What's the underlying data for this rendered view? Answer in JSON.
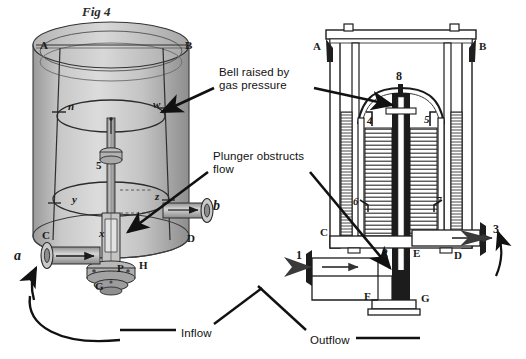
{
  "figure": {
    "title": "Fig 4",
    "background_color": "#ffffff",
    "ink_color": "#1a1a1a",
    "annotation_color": "#111111"
  },
  "annotations": [
    {
      "id": "bell-raised",
      "text": "Bell raised by\ngas pressure",
      "x": 219,
      "y": 66
    },
    {
      "id": "plunger-obstructs",
      "text": "Plunger obstructs\nflow",
      "x": 213,
      "y": 150
    },
    {
      "id": "inflow",
      "text": "Inflow",
      "x": 181,
      "y": 327
    },
    {
      "id": "outflow",
      "text": "Outflow",
      "x": 310,
      "y": 334
    }
  ],
  "left_view": {
    "name": "perspective-view",
    "labels": [
      {
        "id": "A",
        "text": "A",
        "x": 40,
        "y": 39,
        "style": "roman"
      },
      {
        "id": "B",
        "text": "B",
        "x": 185,
        "y": 39,
        "style": "roman"
      },
      {
        "id": "n",
        "text": "n",
        "x": 68,
        "y": 100,
        "style": "italic"
      },
      {
        "id": "w",
        "text": "w",
        "x": 153,
        "y": 98,
        "style": "italic"
      },
      {
        "id": "5",
        "text": "5",
        "x": 96,
        "y": 159,
        "style": "numeral"
      },
      {
        "id": "y",
        "text": "y",
        "x": 72,
        "y": 193,
        "style": "italic"
      },
      {
        "id": "z",
        "text": "z",
        "x": 155,
        "y": 190,
        "style": "italic"
      },
      {
        "id": "C",
        "text": "C",
        "x": 42,
        "y": 229,
        "style": "roman"
      },
      {
        "id": "D",
        "text": "D",
        "x": 187,
        "y": 232,
        "style": "roman"
      },
      {
        "id": "x",
        "text": "x",
        "x": 99,
        "y": 227,
        "style": "italic"
      },
      {
        "id": "a",
        "text": "a",
        "x": 14,
        "y": 252,
        "style": "italic"
      },
      {
        "id": "b",
        "text": "b",
        "x": 213,
        "y": 202,
        "style": "italic"
      },
      {
        "id": "P",
        "text": "P",
        "x": 117,
        "y": 267,
        "style": "roman"
      },
      {
        "id": "H",
        "text": "H",
        "x": 139,
        "y": 262,
        "style": "roman"
      },
      {
        "id": "G",
        "text": "G",
        "x": 97,
        "y": 285,
        "style": "roman"
      }
    ]
  },
  "right_view": {
    "name": "cross-section-view",
    "labels": [
      {
        "id": "A",
        "text": "A",
        "x": 315,
        "y": 44,
        "style": "roman"
      },
      {
        "id": "B",
        "text": "B",
        "x": 481,
        "y": 44,
        "style": "roman"
      },
      {
        "id": "8",
        "text": "8",
        "x": 396,
        "y": 86,
        "style": "numeral"
      },
      {
        "id": "4",
        "text": "4",
        "x": 368,
        "y": 119,
        "style": "numeral"
      },
      {
        "id": "5",
        "text": "5",
        "x": 424,
        "y": 118,
        "style": "numeral"
      },
      {
        "id": "6",
        "text": "6",
        "x": 355,
        "y": 198,
        "style": "numeral"
      },
      {
        "id": "7",
        "text": "7",
        "x": 436,
        "y": 197,
        "style": "numeral"
      },
      {
        "id": "C",
        "text": "C",
        "x": 321,
        "y": 231,
        "style": "roman"
      },
      {
        "id": "D",
        "text": "D",
        "x": 456,
        "y": 253,
        "style": "roman"
      },
      {
        "id": "E",
        "text": "E",
        "x": 414,
        "y": 251,
        "style": "roman"
      },
      {
        "id": "F",
        "text": "F",
        "x": 365,
        "y": 294,
        "style": "roman"
      },
      {
        "id": "G",
        "text": "G",
        "x": 423,
        "y": 296,
        "style": "roman"
      },
      {
        "id": "1",
        "text": "1",
        "x": 297,
        "y": 254,
        "style": "numeral"
      },
      {
        "id": "2",
        "text": "2",
        "x": 383,
        "y": 251,
        "style": "numeral"
      },
      {
        "id": "3",
        "text": "3",
        "x": 495,
        "y": 228,
        "style": "numeral"
      }
    ]
  }
}
